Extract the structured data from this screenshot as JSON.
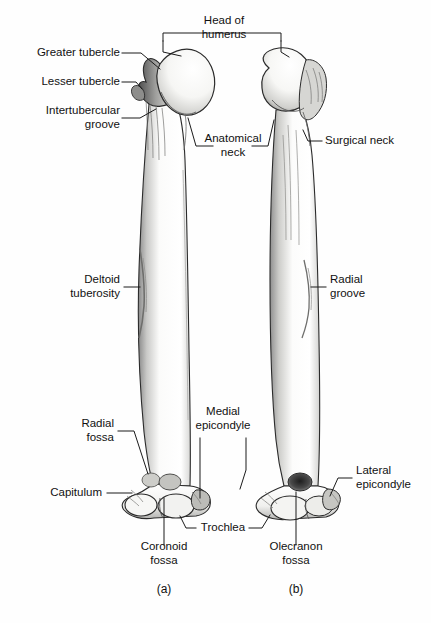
{
  "figure": {
    "subject": "humerus",
    "view_a": "anterior",
    "view_b": "posterior",
    "panel_a_id": "(a)",
    "panel_b_id": "(b)",
    "ink_color": "#1a1a1a",
    "bone_fill": "#fbfbfa",
    "shade_color": "#6f6f6f",
    "background": "#fefefe"
  },
  "labels": {
    "head_of_humerus": "Head of\nhumerus",
    "greater_tubercle": "Greater tubercle",
    "lesser_tubercle": "Lesser tubercle",
    "intertubercular_groove": "Intertubercular\ngroove",
    "anatomical_neck": "Anatomical\nneck",
    "surgical_neck": "Surgical neck",
    "deltoid_tuberosity": "Deltoid\ntuberosity",
    "radial_groove": "Radial\ngroove",
    "radial_fossa": "Radial\nfossa",
    "capitulum": "Capitulum",
    "medial_epicondyle": "Medial\nepicondyle",
    "lateral_epicondyle": "Lateral\nepicondyle",
    "trochlea": "Trochlea",
    "coronoid_fossa": "Coronoid\nfossa",
    "olecranon_fossa": "Olecranon\nfossa"
  },
  "label_list": [
    {
      "key": "greater_tubercle",
      "text": "Greater tubercle",
      "side": "left",
      "panel": "a"
    },
    {
      "key": "lesser_tubercle",
      "text": "Lesser tubercle",
      "side": "left",
      "panel": "a"
    },
    {
      "key": "intertubercular_groove",
      "text": "Intertubercular groove",
      "side": "left",
      "panel": "a"
    },
    {
      "key": "head_of_humerus",
      "text": "Head of humerus",
      "side": "top",
      "panel": "both"
    },
    {
      "key": "anatomical_neck",
      "text": "Anatomical neck",
      "side": "right",
      "panel": "a"
    },
    {
      "key": "surgical_neck",
      "text": "Surgical neck",
      "side": "right",
      "panel": "b"
    },
    {
      "key": "deltoid_tuberosity",
      "text": "Deltoid tuberosity",
      "side": "left",
      "panel": "a"
    },
    {
      "key": "radial_groove",
      "text": "Radial groove",
      "side": "right",
      "panel": "b"
    },
    {
      "key": "radial_fossa",
      "text": "Radial fossa",
      "side": "left",
      "panel": "a"
    },
    {
      "key": "capitulum",
      "text": "Capitulum",
      "side": "left",
      "panel": "a"
    },
    {
      "key": "medial_epicondyle",
      "text": "Medial epicondyle",
      "side": "right",
      "panel": "a"
    },
    {
      "key": "lateral_epicondyle",
      "text": "Lateral epicondyle",
      "side": "right",
      "panel": "b"
    },
    {
      "key": "trochlea",
      "text": "Trochlea",
      "side": "bottom",
      "panel": "both"
    },
    {
      "key": "coronoid_fossa",
      "text": "Coronoid fossa",
      "side": "bottom",
      "panel": "a"
    },
    {
      "key": "olecranon_fossa",
      "text": "Olecranon fossa",
      "side": "bottom",
      "panel": "b"
    }
  ]
}
